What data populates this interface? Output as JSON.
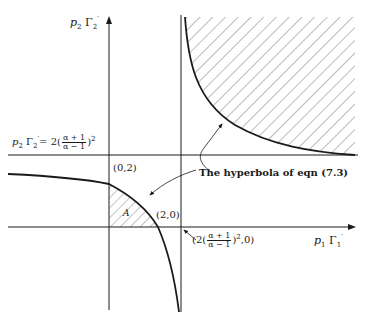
{
  "figure": {
    "y_axis_label": {
      "var": "p",
      "var_sub": "2",
      "gamma": "Γ",
      "gamma_sub": "2",
      "prime": "′"
    },
    "x_axis_label": {
      "var": "p",
      "var_sub": "1",
      "gamma": "Γ",
      "gamma_sub": "1",
      "prime": "′"
    },
    "asymptote_label": {
      "lhs_var": "p",
      "lhs_sub": "2",
      "lhs_gamma": "Γ",
      "lhs_gamma_sub": "2",
      "lhs_prime": "′",
      "eq": "= 2",
      "open": "(",
      "num": "α + 1",
      "den": "α − 1",
      "close": ")",
      "power": "2"
    },
    "point_0_2": "(0,2)",
    "point_2_0": "(2,0)",
    "x_intercept_label": {
      "prefix": "(2",
      "open": "(",
      "num": "α + 1",
      "den": "α − 1",
      "close": ")",
      "power": "2",
      "suffix": ",0)"
    },
    "region_A_label": "A",
    "annotation": "The hyperbola of eqn (7.3)",
    "colors": {
      "ink": "#1a1a1a",
      "background": "#ffffff",
      "hatch": "#555555"
    }
  }
}
